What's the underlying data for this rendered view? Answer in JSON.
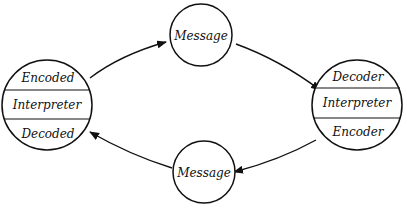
{
  "diagram": {
    "left_node": {
      "top": "Encoded",
      "middle": "Interpreter",
      "bottom": "Decoded"
    },
    "right_node": {
      "top": "Decoder",
      "middle": "Interpreter",
      "bottom": "Encoder"
    },
    "top_message": "Message",
    "bottom_message": "Message",
    "edges": [
      {
        "from": "left_node",
        "to": "top_message"
      },
      {
        "from": "top_message",
        "to": "right_node"
      },
      {
        "from": "right_node",
        "to": "bottom_message"
      },
      {
        "from": "bottom_message",
        "to": "left_node"
      }
    ],
    "colors": {
      "stroke": "#111111",
      "background": "#ffffff"
    }
  }
}
